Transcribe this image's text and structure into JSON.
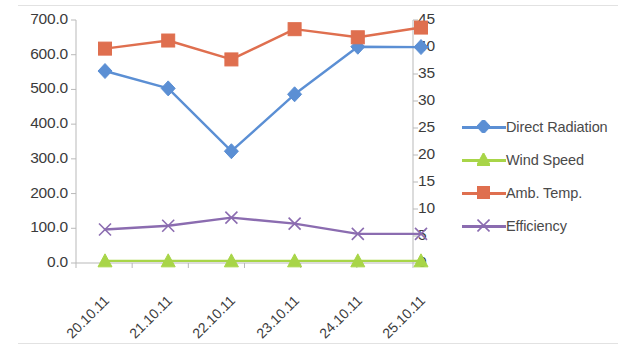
{
  "chart_data": {
    "type": "line",
    "title": "",
    "subtitle": "",
    "xlabel": "",
    "ylabel": "",
    "grid": false,
    "legend_position": "right",
    "categories": [
      "20.10.11",
      "21.10.11",
      "22.10.11",
      "23.10.11",
      "24.10.11",
      "25.10.11"
    ],
    "axes": {
      "left": {
        "label": "",
        "min": 0.0,
        "max": 700.0,
        "step": 100.0,
        "ticks": [
          "0.0",
          "100.0",
          "200.0",
          "300.0",
          "400.0",
          "500.0",
          "600.0",
          "700.0"
        ],
        "tick_values": [
          0.0,
          100.0,
          200.0,
          300.0,
          400.0,
          500.0,
          600.0,
          700.0
        ]
      },
      "right": {
        "label": "",
        "min": 0,
        "max": 45,
        "step": 5,
        "ticks": [
          "0",
          "5",
          "10",
          "15",
          "20",
          "25",
          "30",
          "35",
          "40",
          "45"
        ],
        "tick_values": [
          0,
          5,
          10,
          15,
          20,
          25,
          30,
          35,
          40,
          45
        ]
      }
    },
    "series": [
      {
        "name": "Direct Radiation",
        "axis": "left",
        "color": "#5b8fd4",
        "marker": "diamond",
        "values": [
          553,
          503,
          322,
          486,
          623,
          622
        ]
      },
      {
        "name": "Wind Speed",
        "axis": "right",
        "color": "#a8d548",
        "marker": "triangle",
        "values": [
          0.4,
          0.4,
          0.4,
          0.4,
          0.4,
          0.4
        ]
      },
      {
        "name": "Amb. Temp.",
        "axis": "right",
        "color": "#df6f4f",
        "marker": "square",
        "values": [
          39.7,
          41.2,
          37.7,
          43.3,
          41.8,
          43.6
        ]
      },
      {
        "name": "Efficiency",
        "axis": "right",
        "color": "#8b6cb0",
        "marker": "x",
        "values": [
          6.2,
          6.9,
          8.4,
          7.3,
          5.4,
          5.4
        ]
      }
    ]
  },
  "legend": {
    "items": [
      {
        "label": "Direct Radiation",
        "color": "#5b8fd4",
        "marker": "diamond"
      },
      {
        "label": "Wind Speed",
        "color": "#a8d548",
        "marker": "triangle"
      },
      {
        "label": "Amb. Temp.",
        "color": "#df6f4f",
        "marker": "square"
      },
      {
        "label": "Efficiency",
        "color": "#8b6cb0",
        "marker": "x"
      }
    ]
  }
}
